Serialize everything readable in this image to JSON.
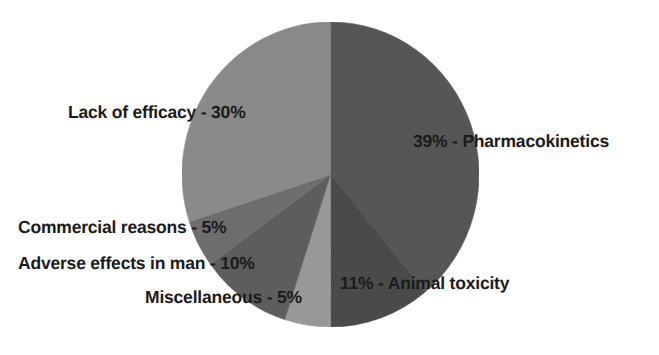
{
  "chart_data": {
    "type": "pie",
    "title": "",
    "subtitle": "",
    "xlabel": "",
    "ylabel": "",
    "legend_position": "none",
    "grid": false,
    "units": "%",
    "start_angle_deg": 0,
    "direction": "clockwise",
    "categories": [
      "Pharmacokinetics",
      "Animal toxicity",
      "Miscellaneous",
      "Adverse effects in man",
      "Commercial reasons",
      "Lack of efficacy"
    ],
    "values": [
      39,
      11,
      5,
      10,
      5,
      30
    ],
    "slices": [
      {
        "name": "Pharmacokinetics",
        "value": 39,
        "label": "39% - Pharmacokinetics",
        "color": "#585858",
        "start_deg": 0,
        "end_deg": 140.4
      },
      {
        "name": "Animal toxicity",
        "value": 11,
        "label": "11% - Animal toxicity",
        "color": "#4b4b4b",
        "start_deg": 140.4,
        "end_deg": 180
      },
      {
        "name": "Miscellaneous",
        "value": 5,
        "label": "Miscellaneous - 5%",
        "color": "#9a9a9a",
        "start_deg": 180,
        "end_deg": 198
      },
      {
        "name": "Adverse effects in man",
        "value": 10,
        "label": "Adverse effects in man - 10%",
        "color": "#5e5e5e",
        "start_deg": 198,
        "end_deg": 234
      },
      {
        "name": "Commercial reasons",
        "value": 5,
        "label": "Commercial reasons - 5%",
        "color": "#6f6f6f",
        "start_deg": 234,
        "end_deg": 252
      },
      {
        "name": "Lack of efficacy",
        "value": 30,
        "label": "Lack of efficacy - 30%",
        "color": "#8b8b8b",
        "start_deg": 252,
        "end_deg": 360
      }
    ],
    "background_color": "#ffffff",
    "label_color": "#1b1b1b"
  }
}
